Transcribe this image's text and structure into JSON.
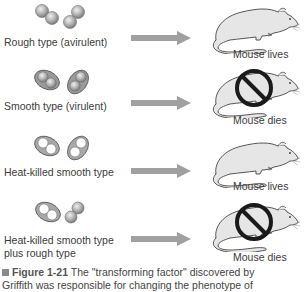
{
  "figure": {
    "rows": [
      {
        "label_lines": [
          "Rough type (avirulent)"
        ],
        "cell_type": "rough",
        "outcome": "Mouse lives",
        "dies": false
      },
      {
        "label_lines": [
          "Smooth type (virulent)"
        ],
        "cell_type": "smooth",
        "outcome": "Mouse dies",
        "dies": true
      },
      {
        "label_lines": [
          "Heat-killed smooth type"
        ],
        "cell_type": "heat-killed-smooth",
        "outcome": "Mouse lives",
        "dies": false
      },
      {
        "label_lines": [
          "Heat-killed smooth type",
          "plus rough type"
        ],
        "cell_type": "heat-killed-smooth-plus-rough",
        "outcome": "Mouse dies",
        "dies": true
      }
    ],
    "caption": {
      "figure_number": "Figure 1-21",
      "text_line1": "The \"transforming factor\" discovered by",
      "text_line2": "Griffith was responsible for changing the phenotype of"
    },
    "colors": {
      "arrow": "#a0a0a0",
      "cell_fill": "#b8b8b8",
      "capsule_fill": "#9a9a9a",
      "prohibition": "#1a1a1a",
      "text": "#3c3c3c"
    }
  }
}
